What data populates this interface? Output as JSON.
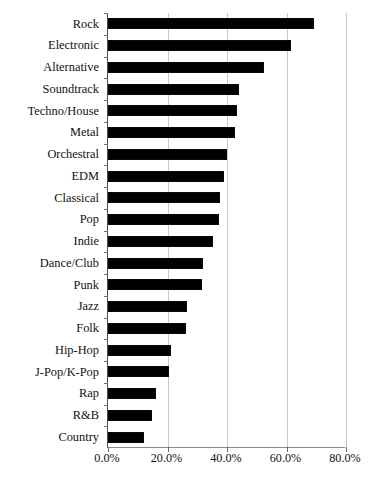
{
  "chart_data": {
    "type": "bar",
    "orientation": "horizontal",
    "title": "",
    "subtitle": "",
    "xlabel": "",
    "ylabel": "",
    "xlim": [
      0,
      80
    ],
    "ylim": null,
    "grid": true,
    "legend": null,
    "legend_position": "none",
    "value_suffix": "%",
    "xticks": [
      "0.0%",
      "20.0%",
      "40.0%",
      "60.0%",
      "80.0%"
    ],
    "xtick_values": [
      0,
      20,
      40,
      60,
      80
    ],
    "bar_color": "#000000",
    "categories": [
      "Rock",
      "Electronic",
      "Alternative",
      "Soundtrack",
      "Techno/House",
      "Metal",
      "Orchestral",
      "EDM",
      "Classical",
      "Pop",
      "Indie",
      "Dance/Club",
      "Punk",
      "Jazz",
      "Folk",
      "Hip-Hop",
      "J-Pop/K-Pop",
      "Rap",
      "R&B",
      "Country"
    ],
    "values": [
      69.4,
      61.5,
      52.4,
      44.0,
      43.4,
      42.7,
      40.0,
      39.0,
      37.6,
      37.2,
      35.3,
      31.9,
      31.6,
      26.6,
      26.2,
      21.2,
      20.5,
      16.1,
      14.8,
      12.1
    ]
  }
}
